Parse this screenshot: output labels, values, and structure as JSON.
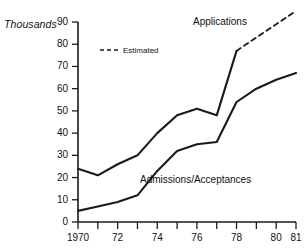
{
  "chart_data": {
    "type": "line",
    "title": "",
    "xlabel": "",
    "ylabel": "Thousands",
    "ylim": [
      0,
      90
    ],
    "xlim": [
      1970,
      1981
    ],
    "grid": false,
    "legend_position": "inside-upper-left",
    "x": [
      1970,
      1971,
      1972,
      1973,
      1974,
      1975,
      1976,
      1977,
      1978,
      1979,
      1980,
      1981
    ],
    "xtick_values": [
      1970,
      1971,
      1972,
      1973,
      1974,
      1975,
      1976,
      1977,
      1978,
      1979,
      1980,
      1981
    ],
    "xtick_labels": [
      "1970",
      "",
      "72",
      "",
      "74",
      "",
      "76",
      "",
      "78",
      "",
      "80",
      "81"
    ],
    "ytick_values": [
      0,
      10,
      20,
      30,
      40,
      50,
      60,
      70,
      80,
      90
    ],
    "ytick_labels": [
      "0",
      "10",
      "20",
      "30",
      "40",
      "50",
      "60",
      "70",
      "80",
      "90"
    ],
    "series": [
      {
        "name": "Applications",
        "style": "solid",
        "x": [
          1970,
          1971,
          1972,
          1973,
          1974,
          1975,
          1976,
          1977,
          1978
        ],
        "values": [
          24,
          21,
          26,
          30,
          40,
          48,
          51,
          48,
          77
        ]
      },
      {
        "name": "Estimated",
        "style": "dashed",
        "x": [
          1978,
          1981
        ],
        "values": [
          77,
          95
        ]
      },
      {
        "name": "Admissions/Acceptances",
        "style": "solid",
        "x": [
          1970,
          1971,
          1972,
          1973,
          1974,
          1975,
          1976,
          1977,
          1978,
          1979,
          1980,
          1981
        ],
        "values": [
          5,
          7,
          9,
          12,
          23,
          32,
          35,
          36,
          54,
          60,
          64,
          67
        ]
      }
    ],
    "annotations": [
      {
        "text": "Applications",
        "x": 1977.0,
        "y": 88
      },
      {
        "text": "Admissions/Acceptances",
        "x": 1974.6,
        "y": 22
      }
    ],
    "colors": {
      "line": "#1a1a1a",
      "axis": "#1a1a1a",
      "background": "#ffffff",
      "text": "#111111"
    }
  },
  "labels": {
    "y_unit": "Thousands",
    "legend_estimated": "Estimated",
    "series_applications": "Applications",
    "series_admissions": "Admissions/Acceptances"
  }
}
